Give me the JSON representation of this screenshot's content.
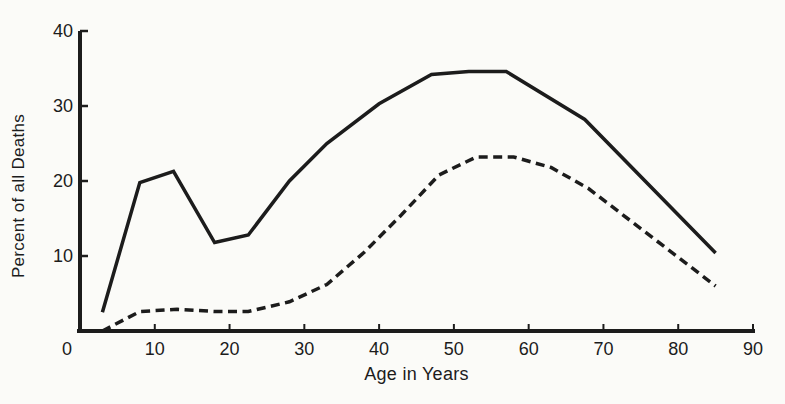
{
  "figure": {
    "background": "#fbfbf8",
    "ink": "#1c1c1c"
  },
  "chart_data": {
    "type": "line",
    "title": "",
    "xlabel": "Age in Years",
    "ylabel": "Percent of all Deaths",
    "xlim": [
      0,
      90
    ],
    "ylim": [
      0,
      40
    ],
    "x_ticks": [
      0,
      10,
      20,
      30,
      40,
      50,
      60,
      70,
      80,
      90
    ],
    "y_ticks": [
      10,
      20,
      30,
      40
    ],
    "grid": false,
    "legend": "none",
    "series": [
      {
        "name": "solid",
        "style": "solid",
        "color": "#1c1c1c",
        "points": [
          [
            3,
            2.5
          ],
          [
            8,
            19.8
          ],
          [
            12.5,
            21.3
          ],
          [
            18,
            11.8
          ],
          [
            22.5,
            12.8
          ],
          [
            28,
            20
          ],
          [
            33,
            25
          ],
          [
            40,
            30.3
          ],
          [
            47,
            34.2
          ],
          [
            52,
            34.6
          ],
          [
            57,
            34.6
          ],
          [
            67.5,
            28.2
          ],
          [
            85,
            10.4
          ]
        ]
      },
      {
        "name": "dashed",
        "style": "dashed",
        "color": "#1c1c1c",
        "points": [
          [
            3,
            0
          ],
          [
            8,
            2.6
          ],
          [
            13,
            2.9
          ],
          [
            18,
            2.6
          ],
          [
            22.5,
            2.6
          ],
          [
            28,
            3.9
          ],
          [
            33,
            6.2
          ],
          [
            38,
            10.5
          ],
          [
            43,
            15.5
          ],
          [
            48,
            20.8
          ],
          [
            53,
            23.2
          ],
          [
            58,
            23.2
          ],
          [
            63,
            21.8
          ],
          [
            68,
            19
          ],
          [
            85,
            6
          ]
        ]
      }
    ]
  }
}
